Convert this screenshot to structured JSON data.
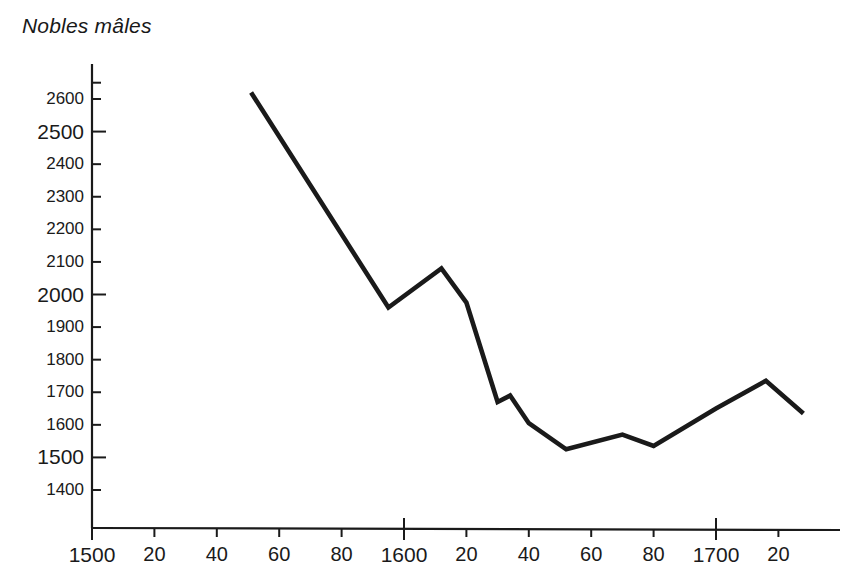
{
  "chart_data": {
    "type": "line",
    "title": "Nobles mâles",
    "xlabel": "",
    "ylabel": "",
    "grid": false,
    "legend": "none",
    "xlim": [
      1500,
      1730
    ],
    "ylim": [
      1370,
      2680
    ],
    "yticks": [
      1400,
      1500,
      1600,
      1700,
      1800,
      1900,
      2000,
      2100,
      2200,
      2300,
      2400,
      2500,
      2600
    ],
    "ytick_labels": [
      "1400",
      "1500",
      "1600",
      "1700",
      "1800",
      "1900",
      "2000",
      "2100",
      "2200",
      "2300",
      "2400",
      "2500",
      "2600"
    ],
    "xticks": [
      1500,
      1520,
      1540,
      1560,
      1580,
      1600,
      1620,
      1640,
      1660,
      1680,
      1700,
      1720
    ],
    "xtick_labels": [
      "1500",
      "20",
      "40",
      "60",
      "80",
      "1600",
      "20",
      "40",
      "60",
      "80",
      "1700",
      "20"
    ],
    "x": [
      1551,
      1595,
      1612,
      1620,
      1630,
      1634,
      1640,
      1652,
      1670,
      1680,
      1700,
      1716,
      1728
    ],
    "values": [
      2620,
      1960,
      2080,
      1975,
      1670,
      1690,
      1605,
      1525,
      1570,
      1535,
      1650,
      1735,
      1635
    ],
    "series": [
      {
        "name": "Nobles mâles",
        "color": "#1a1a1a",
        "points": [
          {
            "x": 1551,
            "y": 2620
          },
          {
            "x": 1595,
            "y": 1960
          },
          {
            "x": 1612,
            "y": 2080
          },
          {
            "x": 1620,
            "y": 1975
          },
          {
            "x": 1630,
            "y": 1670
          },
          {
            "x": 1634,
            "y": 1690
          },
          {
            "x": 1640,
            "y": 1605
          },
          {
            "x": 1652,
            "y": 1525
          },
          {
            "x": 1670,
            "y": 1570
          },
          {
            "x": 1680,
            "y": 1535
          },
          {
            "x": 1700,
            "y": 1650
          },
          {
            "x": 1716,
            "y": 1735
          },
          {
            "x": 1728,
            "y": 1635
          }
        ]
      }
    ]
  },
  "colors": {
    "line": "#1a1a1a",
    "axis": "#1a1a1a",
    "background": "#ffffff",
    "text": "#1a1a1a"
  }
}
